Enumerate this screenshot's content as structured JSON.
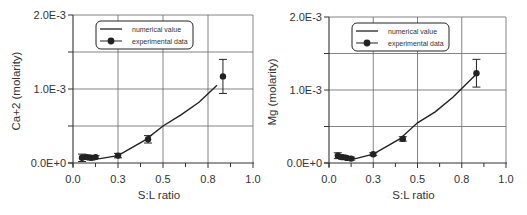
{
  "chart_data": [
    {
      "type": "line",
      "id": "calcium",
      "title": "",
      "xlabel": "S:L ratio",
      "ylabel": "Ca+2 (molarity)",
      "xlim": [
        0.0,
        1.0
      ],
      "ylim": [
        0.0,
        0.002
      ],
      "xticks": [
        0.0,
        0.25,
        0.5,
        0.75,
        1.0
      ],
      "xtick_labels": [
        "0.0",
        "0.3",
        "0.5",
        "0.8",
        "1.0"
      ],
      "yticks": [
        0.0,
        0.001,
        0.002
      ],
      "ytick_labels": [
        "0.0E+0",
        "1.0E-3",
        "2.0E-3"
      ],
      "grid": true,
      "legend": {
        "position": "upper-left",
        "entries": [
          "numerical value",
          "experimental data"
        ]
      },
      "series": [
        {
          "name": "numerical value",
          "style": "line",
          "x": [
            0.05,
            0.1,
            0.15,
            0.25,
            0.4,
            0.5,
            0.6,
            0.7,
            0.8
          ],
          "y": [
            5e-05,
            5e-05,
            6e-05,
            0.0001,
            0.00031,
            0.0005,
            0.00065,
            0.00082,
            0.00105
          ]
        },
        {
          "name": "experimental data",
          "style": "marker-errorbar",
          "x": [
            0.05,
            0.075,
            0.1,
            0.125,
            0.25,
            0.417,
            0.833
          ],
          "y": [
            7e-05,
            8e-05,
            7e-05,
            8e-05,
            0.0001,
            0.00032,
            0.00117
          ],
          "err": [
            5e-05,
            3e-05,
            3e-05,
            2e-05,
            3e-05,
            5e-05,
            0.00023
          ]
        }
      ]
    },
    {
      "type": "line",
      "id": "magnesium",
      "title": "",
      "xlabel": "S:L ratio",
      "ylabel": "Mg (molarity)",
      "xlim": [
        0.0,
        1.0
      ],
      "ylim": [
        0.0,
        0.002
      ],
      "xticks": [
        0.0,
        0.25,
        0.5,
        0.75,
        1.0
      ],
      "xtick_labels": [
        "0.0",
        "0.3",
        "0.5",
        "0.8",
        "1.0"
      ],
      "yticks": [
        0.0,
        0.001,
        0.002
      ],
      "ytick_labels": [
        "0.0E+0",
        "1.0E-3",
        "2.0E-3"
      ],
      "grid": true,
      "legend": {
        "position": "upper-left",
        "entries": [
          "numerical value",
          "experimental data"
        ]
      },
      "series": [
        {
          "name": "numerical value",
          "style": "line",
          "x": [
            0.05,
            0.1,
            0.15,
            0.25,
            0.4,
            0.5,
            0.6,
            0.7,
            0.833
          ],
          "y": [
            8e-05,
            6e-05,
            6e-05,
            0.00012,
            0.00033,
            0.00055,
            0.0007,
            0.0009,
            0.00122
          ]
        },
        {
          "name": "experimental data",
          "style": "marker-errorbar",
          "x": [
            0.05,
            0.075,
            0.1,
            0.125,
            0.25,
            0.417,
            0.833
          ],
          "y": [
            0.0001,
            8e-05,
            7e-05,
            6e-05,
            0.00012,
            0.00033,
            0.00123
          ],
          "err": [
            4e-05,
            3e-05,
            2e-05,
            2e-05,
            2e-05,
            3e-05,
            0.00019
          ]
        }
      ]
    }
  ],
  "panels": [
    {
      "ylabel": "Ca+2 (molarity)",
      "xlabel": "S:L ratio",
      "legend_line": "numerical value",
      "legend_marker": "experimental data"
    },
    {
      "ylabel": "Mg (molarity)",
      "xlabel": "S:L ratio",
      "legend_line": "numerical value",
      "legend_marker": "experimental data"
    }
  ]
}
